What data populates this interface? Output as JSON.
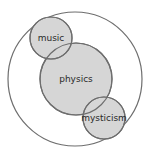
{
  "diagram": {
    "type": "venn",
    "colors": {
      "background": "#ffffff",
      "stroke": "#6e6e6e",
      "fill": "#d6d6d6",
      "text": "#2a2a2a"
    },
    "outer": {
      "cx": 75,
      "cy": 79,
      "r": 67
    },
    "sets": [
      {
        "id": "music",
        "label": "music",
        "cx": 51,
        "cy": 38,
        "r": 21
      },
      {
        "id": "physics",
        "label": "physics",
        "cx": 76,
        "cy": 79,
        "r": 36
      },
      {
        "id": "mysticism",
        "label": "mysticism",
        "cx": 104,
        "cy": 118,
        "r": 21
      }
    ]
  }
}
